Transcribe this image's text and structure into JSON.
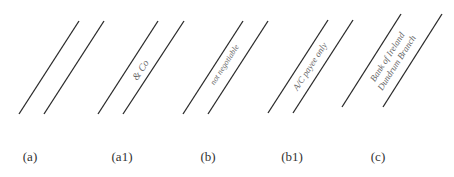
{
  "figure": {
    "line_color": "#2a2a2a",
    "text_color": "#666666",
    "crossings": [
      {
        "id": "a",
        "label": "(a)",
        "label_x": 30,
        "lines": [
          [
            19,
            114,
            79,
            21
          ],
          [
            44,
            114,
            104,
            21
          ]
        ],
        "text_lines": []
      },
      {
        "id": "a1",
        "label": "(a1)",
        "label_x": 122,
        "lines": [
          [
            98,
            114,
            158,
            21
          ],
          [
            123,
            114,
            184,
            21
          ]
        ],
        "text_lines": [
          "& Co"
        ],
        "text_center": [
          141,
          70
        ],
        "text_size": 10
      },
      {
        "id": "b",
        "label": "(b)",
        "label_x": 208,
        "lines": [
          [
            183,
            114,
            243,
            21
          ],
          [
            208,
            114,
            268,
            21
          ]
        ],
        "text_lines": [
          "not negotiable"
        ],
        "text_center": [
          225,
          65
        ],
        "text_size": 8
      },
      {
        "id": "b1",
        "label": "(b1)",
        "label_x": 292,
        "lines": [
          [
            268,
            113,
            328,
            20
          ],
          [
            293,
            113,
            353,
            20
          ]
        ],
        "text_lines": [
          "A/C payee only"
        ],
        "text_center": [
          310,
          66
        ],
        "text_size": 9
      },
      {
        "id": "c",
        "label": "(c)",
        "label_x": 378,
        "lines": [
          [
            342,
            107,
            401,
            14
          ],
          [
            383,
            107,
            442,
            14
          ]
        ],
        "text_lines": [
          "Bank of Ireland",
          "Dundrum Branch"
        ],
        "text_center": [
          392,
          60
        ],
        "text_size": 9
      }
    ]
  }
}
